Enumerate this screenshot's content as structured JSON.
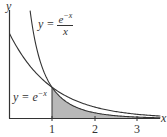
{
  "chart_data": {
    "type": "line",
    "title": "",
    "xlabel": "x",
    "ylabel": "y",
    "xlim": [
      0,
      3.6
    ],
    "ylim": [
      0,
      1.3
    ],
    "x_ticks": [
      "1",
      "2",
      "3"
    ],
    "grid": false,
    "series": [
      {
        "name": "y = e^-x",
        "formula": "exp(-x)",
        "x": [
          0,
          0.5,
          1,
          1.5,
          2,
          2.5,
          3,
          3.5
        ],
        "values": [
          1.0,
          0.607,
          0.368,
          0.223,
          0.135,
          0.082,
          0.05,
          0.03
        ]
      },
      {
        "name": "y = e^-x / x",
        "formula": "exp(-x)/x",
        "x": [
          0.25,
          0.5,
          1,
          1.5,
          2,
          2.5,
          3,
          3.5
        ],
        "values": [
          3.115,
          1.213,
          0.368,
          0.149,
          0.068,
          0.033,
          0.017,
          0.009
        ]
      }
    ],
    "shaded_region": {
      "description": "area under y = e^-x / x from x = 1 onward",
      "from": 1,
      "to": 3.6,
      "color": "#b8b8b8"
    },
    "annotations": [
      {
        "text": "y = e^-x / x",
        "position": "upper middle"
      },
      {
        "text": "y = e^-x",
        "position": "left, near x = 1"
      }
    ]
  },
  "labels": {
    "y_axis": "y",
    "x_axis": "x",
    "tick_1": "1",
    "tick_2": "2",
    "tick_3": "3",
    "eq1_lhs": "y = ",
    "eq1_num": "e",
    "eq1_num_exp": "−x",
    "eq1_den": "x",
    "eq2_lhs": "y = e",
    "eq2_exp": "−x"
  },
  "colors": {
    "curve": "#333333",
    "fill": "#b8b8b8",
    "axis": "#333333"
  }
}
